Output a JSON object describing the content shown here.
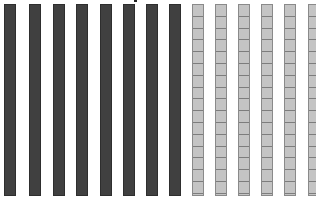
{
  "diagram": {
    "colors": {
      "dark_rod": "#404040",
      "light_rod": "#c4c4c4",
      "segment_line": "#7d7d7d",
      "background": "#ffffff"
    },
    "rods": [
      {
        "type": "dark",
        "x": 4
      },
      {
        "type": "dark",
        "x": 29
      },
      {
        "type": "dark",
        "x": 53
      },
      {
        "type": "dark",
        "x": 76
      },
      {
        "type": "dark",
        "x": 100
      },
      {
        "type": "dark",
        "x": 123
      },
      {
        "type": "dark",
        "x": 146
      },
      {
        "type": "dark",
        "x": 169
      },
      {
        "type": "light",
        "x": 192
      },
      {
        "type": "light",
        "x": 215
      },
      {
        "type": "light",
        "x": 238
      },
      {
        "type": "light",
        "x": 261
      },
      {
        "type": "light",
        "x": 284
      },
      {
        "type": "light",
        "x": 308
      }
    ],
    "counts": {
      "dark_rods": 8,
      "light_rods": 6,
      "total_rods": 14
    }
  }
}
